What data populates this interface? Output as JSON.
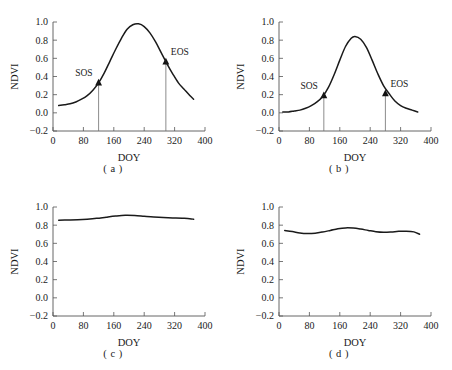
{
  "figure": {
    "panels": [
      {
        "id": "a",
        "caption": "( a )",
        "xlabel": "DOY",
        "ylabel": "NDVI"
      },
      {
        "id": "b",
        "caption": "( b )",
        "xlabel": "DOY",
        "ylabel": "NDVI"
      },
      {
        "id": "c",
        "caption": "( c )",
        "xlabel": "DOY",
        "ylabel": "NDVI"
      },
      {
        "id": "d",
        "caption": "( d )",
        "xlabel": "DOY",
        "ylabel": "NDVI"
      }
    ]
  },
  "chart_data": [
    {
      "type": "line",
      "panel": "a",
      "title": "",
      "xlabel": "DOY",
      "ylabel": "NDVI",
      "xlim": [
        0,
        400
      ],
      "ylim": [
        -0.2,
        1.0
      ],
      "xticks": [
        0,
        80,
        160,
        240,
        320,
        400
      ],
      "yticks": [
        -0.2,
        0.0,
        0.2,
        0.4,
        0.6,
        0.8,
        1.0
      ],
      "xtick_labels": [
        "0",
        "80",
        "160",
        "240",
        "320",
        "400"
      ],
      "ytick_labels": [
        "-0.2",
        "0.0",
        "0.2",
        "0.4",
        "0.6",
        "0.8",
        "1.0"
      ],
      "grid": false,
      "legend": "none",
      "x": [
        15,
        30,
        45,
        60,
        75,
        90,
        105,
        120,
        135,
        150,
        165,
        180,
        195,
        210,
        225,
        240,
        255,
        270,
        285,
        300,
        315,
        330,
        345,
        360,
        370
      ],
      "y": [
        0.08,
        0.09,
        0.1,
        0.12,
        0.15,
        0.19,
        0.25,
        0.33,
        0.44,
        0.57,
        0.7,
        0.82,
        0.92,
        0.97,
        0.98,
        0.95,
        0.88,
        0.78,
        0.66,
        0.54,
        0.43,
        0.33,
        0.26,
        0.19,
        0.15
      ],
      "annotations": [
        {
          "label": "SOS",
          "x": 120,
          "y": 0.33
        },
        {
          "label": "EOS",
          "x": 297,
          "y": 0.56
        }
      ]
    },
    {
      "type": "line",
      "panel": "b",
      "title": "",
      "xlabel": "DOY",
      "ylabel": "NDVI",
      "xlim": [
        0,
        400
      ],
      "ylim": [
        -0.2,
        1.0
      ],
      "xticks": [
        0,
        80,
        160,
        240,
        320,
        400
      ],
      "yticks": [
        -0.2,
        0.0,
        0.2,
        0.4,
        0.6,
        0.8,
        1.0
      ],
      "xtick_labels": [
        "0",
        "80",
        "160",
        "240",
        "320",
        "400"
      ],
      "ytick_labels": [
        "-0.2",
        "0.0",
        "0.2",
        "0.4",
        "0.6",
        "0.8",
        "1.0"
      ],
      "grid": false,
      "legend": "none",
      "x": [
        10,
        25,
        40,
        55,
        70,
        85,
        100,
        115,
        130,
        145,
        160,
        175,
        190,
        200,
        215,
        230,
        245,
        260,
        275,
        290,
        305,
        320,
        335,
        350,
        365
      ],
      "y": [
        0.01,
        0.01,
        0.02,
        0.03,
        0.05,
        0.08,
        0.12,
        0.18,
        0.28,
        0.42,
        0.58,
        0.73,
        0.82,
        0.84,
        0.81,
        0.72,
        0.58,
        0.43,
        0.3,
        0.21,
        0.13,
        0.08,
        0.05,
        0.03,
        0.01
      ],
      "annotations": [
        {
          "label": "SOS",
          "x": 118,
          "y": 0.19
        },
        {
          "label": "EOS",
          "x": 280,
          "y": 0.21
        }
      ]
    },
    {
      "type": "line",
      "panel": "c",
      "title": "",
      "xlabel": "DOY",
      "ylabel": "NDVI",
      "xlim": [
        0,
        400
      ],
      "ylim": [
        -0.2,
        1.0
      ],
      "xticks": [
        0,
        80,
        160,
        240,
        320,
        400
      ],
      "yticks": [
        -0.2,
        0.0,
        0.2,
        0.4,
        0.6,
        0.8,
        1.0
      ],
      "xtick_labels": [
        "0",
        "80",
        "160",
        "240",
        "320",
        "400"
      ],
      "ytick_labels": [
        "-0.2",
        "0.0",
        "0.2",
        "0.4",
        "0.6",
        "0.8",
        "1.0"
      ],
      "grid": false,
      "legend": "none",
      "x": [
        15,
        40,
        65,
        90,
        115,
        140,
        165,
        190,
        215,
        240,
        265,
        290,
        315,
        340,
        360,
        370
      ],
      "y": [
        0.855,
        0.857,
        0.86,
        0.866,
        0.875,
        0.888,
        0.9,
        0.908,
        0.906,
        0.898,
        0.89,
        0.884,
        0.88,
        0.876,
        0.872,
        0.865
      ],
      "annotations": []
    },
    {
      "type": "line",
      "panel": "d",
      "title": "",
      "xlabel": "DOY",
      "ylabel": "NDVI",
      "xlim": [
        0,
        400
      ],
      "ylim": [
        -0.2,
        1.0
      ],
      "xticks": [
        0,
        80,
        160,
        240,
        320,
        400
      ],
      "yticks": [
        -0.2,
        0.0,
        0.2,
        0.4,
        0.6,
        0.8,
        1.0
      ],
      "xtick_labels": [
        "0",
        "80",
        "160",
        "240",
        "320",
        "400"
      ],
      "ytick_labels": [
        "-0.2",
        "0.0",
        "0.2",
        "0.4",
        "0.6",
        "0.8",
        "1.0"
      ],
      "grid": false,
      "legend": "none",
      "x": [
        15,
        35,
        55,
        75,
        95,
        115,
        135,
        155,
        175,
        195,
        215,
        235,
        255,
        275,
        295,
        315,
        335,
        355,
        370
      ],
      "y": [
        0.742,
        0.73,
        0.714,
        0.708,
        0.712,
        0.725,
        0.742,
        0.76,
        0.77,
        0.768,
        0.757,
        0.742,
        0.728,
        0.722,
        0.725,
        0.732,
        0.734,
        0.726,
        0.7
      ],
      "annotations": []
    }
  ],
  "colors": {
    "curve": "#1a1a1a",
    "axis": "#555555",
    "dropline": "#6e6e6e",
    "background": "#ffffff"
  }
}
